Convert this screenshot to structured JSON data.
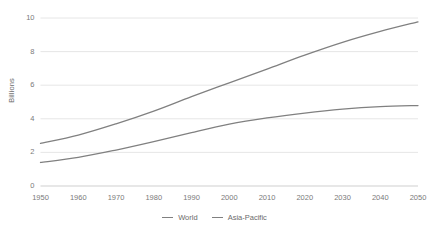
{
  "chart_data": {
    "type": "line",
    "title": "",
    "subtitle": "",
    "xlabel": "",
    "ylabel": "Billions",
    "xlim": [
      1950,
      2050
    ],
    "ylim": [
      0,
      10
    ],
    "grid": true,
    "legend_position": "bottom",
    "x": [
      1950,
      1960,
      1970,
      1980,
      1990,
      2000,
      2010,
      2020,
      2030,
      2040,
      2050
    ],
    "xtick_labels": [
      "1950",
      "1960",
      "1970",
      "1980",
      "1990",
      "2000",
      "2010",
      "2020",
      "2030",
      "2040",
      "2050"
    ],
    "ytick_labels": [
      "0",
      "2",
      "4",
      "6",
      "8",
      "10"
    ],
    "yticks": [
      0,
      2,
      4,
      6,
      8,
      10
    ],
    "series": [
      {
        "name": "World",
        "color": "#808080",
        "values": [
          2.54,
          3.03,
          3.7,
          4.46,
          5.32,
          6.14,
          6.96,
          7.79,
          8.55,
          9.2,
          9.77
        ]
      },
      {
        "name": "Asia-Pacific",
        "color": "#808080",
        "values": [
          1.4,
          1.7,
          2.14,
          2.64,
          3.18,
          3.68,
          4.05,
          4.34,
          4.57,
          4.72,
          4.79
        ]
      }
    ]
  },
  "legend": {
    "items": [
      {
        "label": "World"
      },
      {
        "label": "Asia-Pacific"
      }
    ]
  },
  "colors": {
    "line": "#808080",
    "gridline": "#e3e3e3",
    "axis_text": "#7a7a7a",
    "title_text": "#6b6b6b",
    "background": "#ffffff"
  }
}
